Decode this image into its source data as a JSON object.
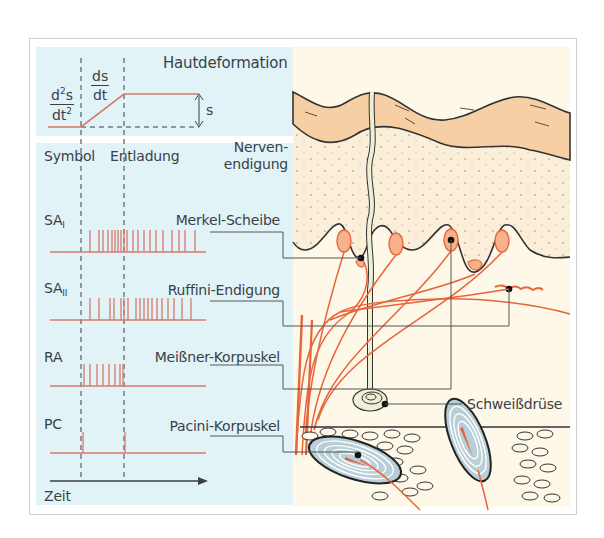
{
  "figure": {
    "top_panel": {
      "title": "Hautdeformation",
      "accel_numerator": "d",
      "accel_numerator_sup": "2",
      "accel_numerator_tail": "s",
      "accel_denominator": "dt",
      "accel_denominator_sup": "2",
      "velocity_numerator": "ds",
      "velocity_denominator": "dt",
      "amplitude_label": "s"
    },
    "columns": {
      "symbol": "Symbol",
      "discharge": "Entladung",
      "nerve_ending_line1": "Nerven-",
      "nerve_ending_line2": "endigung"
    },
    "receptors": [
      {
        "symbol": "SA",
        "sub": "I",
        "ending": "Merkel-Scheibe",
        "spike_count": 21,
        "pattern": "slowly adapting, continuous firing during ramp and hold"
      },
      {
        "symbol": "SA",
        "sub": "II",
        "ending": "Ruffini-Endigung",
        "spike_count": 20,
        "pattern": "slowly adapting, irregular sustained firing"
      },
      {
        "symbol": "RA",
        "sub": "",
        "ending": "Meißner-Korpuskel",
        "spike_count": 8,
        "pattern": "rapidly adapting, fires only during ramp"
      },
      {
        "symbol": "PC",
        "sub": "",
        "ending": "Pacini-Korpuskel",
        "spike_count": 2,
        "pattern": "fires at onset and end of ramp (acceleration)"
      }
    ],
    "extra_label": "Schweißdrüse",
    "time_axis_label": "Zeit",
    "colors": {
      "panel_bg": "#e2f3f8",
      "trace": "#d9776a",
      "text": "#3a3f47",
      "epidermis": "#f6cfa4",
      "dermis": "#fbefd9",
      "subcutis": "#fdf8e8",
      "nerve": "#e8643a",
      "corpuscle_fill": "#b8cfd8"
    }
  }
}
